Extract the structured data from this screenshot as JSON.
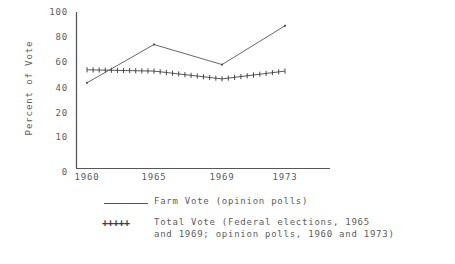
{
  "chart_data": {
    "type": "line",
    "title": "",
    "xlabel": "",
    "ylabel": "Percent of Vote",
    "x": [
      1960,
      1965,
      1969,
      1973
    ],
    "xtick_labels": [
      "1960",
      "1965",
      "1969",
      "1973"
    ],
    "ytick_labels": [
      "100",
      "80",
      "60",
      "40",
      "20",
      "10",
      "0"
    ],
    "ytick_values": [
      100,
      80,
      60,
      40,
      20,
      10,
      0
    ],
    "ylim": [
      0,
      100
    ],
    "grid": false,
    "legend_position": "below-left",
    "series": [
      {
        "name": "Farm Vote (opinion polls)",
        "marker": "none",
        "style": "solid-line",
        "values": [
          44,
          74,
          58,
          89
        ]
      },
      {
        "name": "Total Vote (Federal elections, 1965 and 1969; opinion polls, 1960 and 1973)",
        "marker": "plus",
        "style": "cross-marked-line",
        "values": [
          54,
          53,
          47,
          53
        ]
      }
    ],
    "annotations": []
  },
  "axis": {
    "y_title": "Percent of Vote",
    "y_ticks": [
      {
        "label": "100"
      },
      {
        "label": "80"
      },
      {
        "label": "60"
      },
      {
        "label": "40"
      },
      {
        "label": "20"
      },
      {
        "label": "10"
      },
      {
        "label": "0"
      }
    ],
    "x_ticks": [
      {
        "label": "1960"
      },
      {
        "label": "1965"
      },
      {
        "label": "1969"
      },
      {
        "label": "1973"
      }
    ]
  },
  "legend": {
    "entries": [
      {
        "key": "line",
        "line1": "Farm Vote (opinion polls)",
        "line2": ""
      },
      {
        "key": "plus",
        "symbol": "+++++",
        "line1": "Total Vote (Federal elections, 1965",
        "line2": "and 1969; opinion polls, 1960 and 1973)"
      }
    ]
  },
  "colors": {
    "ink": "#57575a",
    "text": "#5d5d60",
    "background": "#ffffff"
  }
}
